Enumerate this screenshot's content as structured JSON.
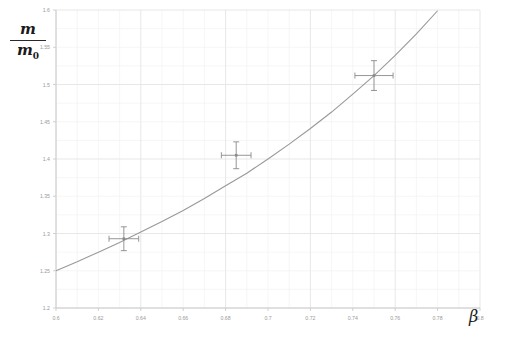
{
  "chart_data": {
    "type": "line",
    "title": "",
    "xlabel": "β",
    "ylabel_numerator": "m",
    "ylabel_denominator": "m",
    "ylabel_denominator_sub": "0",
    "ylabel": "m/m_0",
    "xlim": [
      0.6,
      0.8
    ],
    "ylim": [
      1.2,
      1.6
    ],
    "xticks": [
      0.6,
      0.62,
      0.64,
      0.66,
      0.68,
      0.7,
      0.72,
      0.74,
      0.76,
      0.78,
      0.8
    ],
    "xtick_labels": [
      "0.6",
      "0.62",
      "0.64",
      "0.66",
      "0.68",
      "0.7",
      "0.72",
      "0.74",
      "0.76",
      "0.78",
      "0.8"
    ],
    "yticks": [
      1.2,
      1.25,
      1.3,
      1.35,
      1.4,
      1.45,
      1.5,
      1.55,
      1.6
    ],
    "ytick_labels": [
      "1.2",
      "1.25",
      "1.3",
      "1.35",
      "1.4",
      "1.45",
      "1.5",
      "1.55",
      "1.6"
    ],
    "grid": true,
    "legend": "none",
    "series": [
      {
        "name": "relativistic mass curve",
        "type": "line",
        "color": "#999999",
        "x": [
          0.6,
          0.61,
          0.62,
          0.63,
          0.64,
          0.65,
          0.66,
          0.67,
          0.68,
          0.69,
          0.7,
          0.71,
          0.72,
          0.73,
          0.74,
          0.75,
          0.76,
          0.77,
          0.78
        ],
        "y": [
          1.25,
          1.262,
          1.275,
          1.288,
          1.302,
          1.316,
          1.331,
          1.347,
          1.364,
          1.381,
          1.4,
          1.42,
          1.441,
          1.463,
          1.487,
          1.512,
          1.539,
          1.568,
          1.599
        ]
      },
      {
        "name": "measured points",
        "type": "scatter",
        "color": "#8a8a8a",
        "points": [
          {
            "x": 0.632,
            "y": 1.293,
            "xerr": 0.007,
            "yerr": 0.016
          },
          {
            "x": 0.685,
            "y": 1.405,
            "xerr": 0.007,
            "yerr": 0.018
          },
          {
            "x": 0.75,
            "y": 1.512,
            "xerr": 0.009,
            "yerr": 0.02
          }
        ]
      }
    ]
  },
  "colors": {
    "grid_major": "#e4e4e4",
    "grid_minor": "#f2f2f2",
    "axis": "#cccccc",
    "curve": "#a0a0a0",
    "marker": "#8c8c8c",
    "tick_label": "#9a9a9a",
    "axis_label": "#1a1a1a",
    "background": "#ffffff"
  }
}
